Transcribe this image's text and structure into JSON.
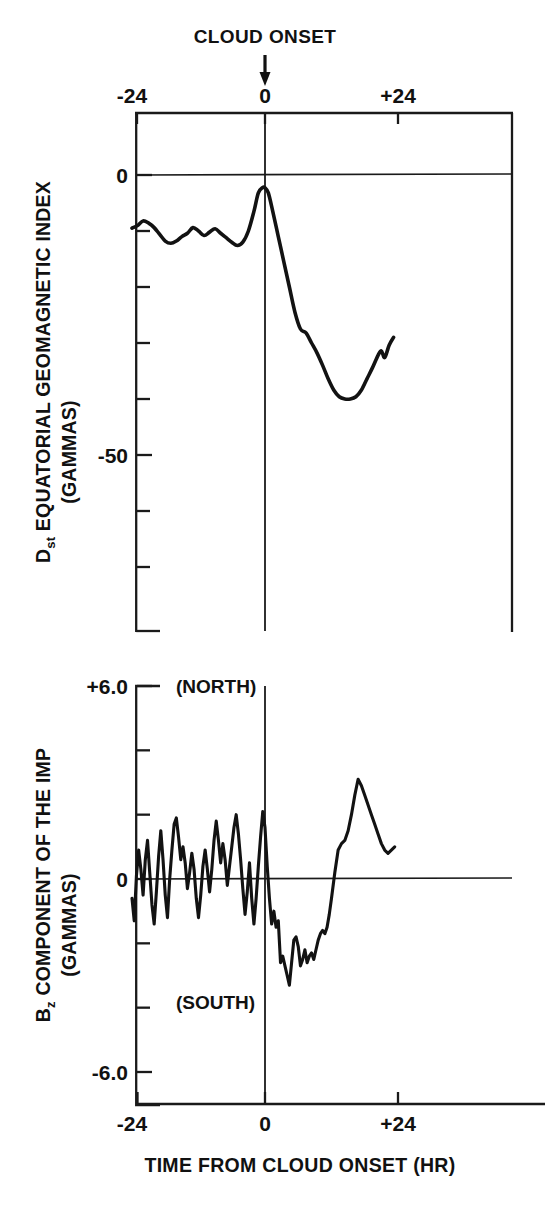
{
  "header": {
    "onset_label": "CLOUD ONSET",
    "arrow_icon": "down-arrow-icon"
  },
  "xaxis": {
    "title": "TIME FROM CLOUD ONSET (HR)",
    "ticks": [
      {
        "label": "-24",
        "value": -24
      },
      {
        "label": "0",
        "value": 0
      },
      {
        "label": "+24",
        "value": 24
      }
    ],
    "range": [
      -24,
      44
    ]
  },
  "panels": {
    "top": {
      "ylabel_main": "EQUATORIAL GEOMAGNETIC INDEX",
      "ylabel_prefix": "D",
      "ylabel_prefix_sub": "st",
      "ylabel_units": "(GAMMAS)",
      "ticks": [
        {
          "label": "0",
          "value": 0
        },
        {
          "label": "-50",
          "value": -50
        }
      ],
      "minor_tick_values": [
        -10,
        -20,
        -30,
        -40,
        -60,
        -70
      ],
      "range": [
        -80,
        8
      ]
    },
    "bottom": {
      "ylabel_main": "COMPONENT OF THE IMP",
      "ylabel_prefix": "B",
      "ylabel_prefix_sub": "z",
      "ylabel_units": "(GAMMAS)",
      "north_label": "(NORTH)",
      "south_label": "(SOUTH)",
      "ticks": [
        {
          "label": "+6.0",
          "value": 6.0
        },
        {
          "label": "0",
          "value": 0.0
        },
        {
          "label": "-6.0",
          "value": -6.0
        }
      ],
      "minor_tick_values": [
        4,
        2,
        -2,
        -4,
        -8
      ],
      "range": [
        -9.2,
        6.6
      ]
    }
  },
  "chart_data": [
    {
      "type": "line",
      "title": "Dst Equatorial Geomagnetic Index",
      "xlabel": "TIME FROM CLOUD ONSET (HR)",
      "ylabel": "Dst EQUATORIAL GEOMAGNETIC INDEX (GAMMAS)",
      "xlim": [
        -24,
        44
      ],
      "ylim": [
        -80,
        8
      ],
      "grid": false,
      "legend": "none",
      "annotations": [
        "CLOUD ONSET at t = 0"
      ],
      "x": [
        -24.0,
        -23.0,
        -22.0,
        -21.0,
        -20.0,
        -19.0,
        -18.0,
        -17.0,
        -16.0,
        -15.0,
        -14.0,
        -13.0,
        -12.0,
        -11.0,
        -10.0,
        -9.0,
        -8.0,
        -7.0,
        -6.0,
        -5.0,
        -4.0,
        -3.0,
        -2.0,
        -1.2,
        -0.4,
        0.0,
        0.6,
        1.4,
        2.4,
        3.4,
        4.4,
        5.4,
        6.4,
        7.4,
        8.4,
        9.4,
        10.4,
        11.4,
        12.4,
        13.4,
        14.4,
        15.4,
        16.4,
        17.4,
        18.4,
        19.4,
        20.4,
        21.0,
        21.6,
        22.4,
        23.2
      ],
      "y": [
        -9.5,
        -9.0,
        -8.2,
        -8.6,
        -9.4,
        -10.6,
        -11.8,
        -12.2,
        -11.8,
        -11.0,
        -10.4,
        -9.4,
        -10.0,
        -10.8,
        -10.2,
        -9.6,
        -10.4,
        -11.2,
        -12.0,
        -12.6,
        -12.0,
        -10.0,
        -6.5,
        -3.2,
        -2.2,
        -2.3,
        -3.2,
        -6.5,
        -11.0,
        -15.5,
        -20.0,
        -24.5,
        -27.5,
        -28.2,
        -30.0,
        -31.8,
        -34.0,
        -36.4,
        -38.4,
        -39.6,
        -40.0,
        -40.0,
        -39.6,
        -38.4,
        -36.4,
        -34.4,
        -32.2,
        -31.4,
        -32.6,
        -30.4,
        -29.0
      ]
    },
    {
      "type": "line",
      "title": "Bz Component of the IMF",
      "xlabel": "TIME FROM CLOUD ONSET (HR)",
      "ylabel": "Bz COMPONENT OF THE IMP (GAMMAS)",
      "xlim": [
        -24,
        44
      ],
      "ylim": [
        -9.2,
        6.6
      ],
      "grid": false,
      "legend": "none",
      "annotations": [
        "(NORTH) upper region",
        "(SOUTH) lower region",
        "CLOUD ONSET at t = 0"
      ],
      "x": [
        -24.0,
        -23.6,
        -23.2,
        -22.8,
        -22.4,
        -22.0,
        -21.6,
        -21.2,
        -20.8,
        -20.4,
        -20.0,
        -19.6,
        -19.2,
        -18.8,
        -18.4,
        -18.0,
        -17.6,
        -17.2,
        -16.8,
        -16.4,
        -16.0,
        -15.6,
        -15.2,
        -14.8,
        -14.4,
        -14.0,
        -13.6,
        -13.2,
        -12.8,
        -12.4,
        -12.0,
        -11.6,
        -11.2,
        -10.8,
        -10.4,
        -10.0,
        -9.6,
        -9.2,
        -8.8,
        -8.4,
        -8.0,
        -7.6,
        -7.2,
        -6.8,
        -6.4,
        -6.0,
        -5.6,
        -5.2,
        -4.8,
        -4.4,
        -4.0,
        -3.6,
        -3.2,
        -2.8,
        -2.4,
        -2.0,
        -1.6,
        -1.2,
        -0.8,
        -0.4,
        0.0,
        0.4,
        0.8,
        1.2,
        1.6,
        2.0,
        2.4,
        2.8,
        3.2,
        3.6,
        4.0,
        4.4,
        4.8,
        5.2,
        5.6,
        6.0,
        6.4,
        6.8,
        7.2,
        7.6,
        8.0,
        8.4,
        8.8,
        9.2,
        9.6,
        10.0,
        10.4,
        10.8,
        11.2,
        11.6,
        12.0,
        12.6,
        13.2,
        13.8,
        14.4,
        15.0,
        15.6,
        16.2,
        16.8,
        17.4,
        18.0,
        18.6,
        19.2,
        19.8,
        20.4,
        21.0,
        21.6,
        22.2,
        22.8,
        23.4
      ],
      "y": [
        -0.6,
        -1.3,
        0.1,
        0.9,
        0.3,
        -0.5,
        0.6,
        1.2,
        0.2,
        -0.8,
        -1.4,
        -0.4,
        0.7,
        1.5,
        0.6,
        -0.5,
        -1.2,
        0.0,
        0.9,
        1.7,
        1.9,
        1.3,
        0.6,
        1.0,
        0.5,
        -0.3,
        0.2,
        0.8,
        0.3,
        -0.6,
        -1.2,
        -0.5,
        0.4,
        0.9,
        0.3,
        -0.4,
        0.3,
        1.2,
        1.8,
        1.2,
        0.5,
        1.1,
        0.6,
        -0.2,
        0.4,
        1.0,
        1.6,
        2.0,
        1.4,
        0.6,
        -0.3,
        -1.1,
        -0.4,
        0.5,
        -0.6,
        -1.4,
        -0.6,
        0.4,
        1.3,
        2.1,
        1.6,
        0.4,
        -0.6,
        -1.4,
        -1.0,
        -1.5,
        -1.3,
        -2.6,
        -2.4,
        -2.7,
        -3.0,
        -3.3,
        -2.6,
        -1.9,
        -1.8,
        -2.1,
        -2.7,
        -2.5,
        -2.2,
        -2.6,
        -2.4,
        -2.3,
        -2.5,
        -2.2,
        -1.9,
        -1.7,
        -1.6,
        -1.7,
        -1.5,
        -1.1,
        -0.6,
        0.2,
        0.9,
        1.1,
        1.2,
        1.5,
        2.0,
        2.6,
        3.1,
        2.9,
        2.6,
        2.3,
        2.0,
        1.7,
        1.4,
        1.1,
        0.9,
        0.8,
        0.9,
        1.0
      ]
    }
  ]
}
